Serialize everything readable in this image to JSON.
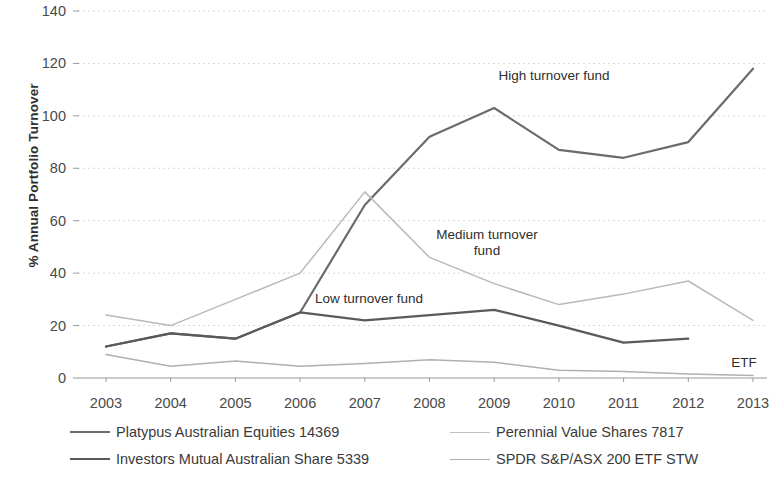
{
  "chart_data": {
    "type": "line",
    "title": "",
    "xlabel": "",
    "ylabel": "% Annual Portfolio Turnover",
    "x": [
      2003,
      2004,
      2005,
      2006,
      2007,
      2008,
      2009,
      2010,
      2011,
      2012,
      2013
    ],
    "xtick_labels": [
      "2003",
      "2004",
      "2005",
      "2006",
      "2007",
      "2008",
      "2009",
      "2010",
      "2011",
      "2012",
      "2013"
    ],
    "ytick_labels": [
      "0",
      "20",
      "40",
      "60",
      "80",
      "100",
      "120",
      "140"
    ],
    "yticks": [
      0,
      20,
      40,
      60,
      80,
      100,
      120,
      140
    ],
    "ylim": [
      0,
      140
    ],
    "grid": "horizontal-dotted",
    "legend_position": "bottom",
    "series": [
      {
        "name": "Platypus Australian Equities 14369",
        "color": "#6b6b6b",
        "width": 2.2,
        "x": [
          2003,
          2004,
          2005,
          2006,
          2007,
          2008,
          2009,
          2010,
          2011,
          2012,
          2013
        ],
        "values": [
          12,
          17,
          15,
          25,
          66,
          92,
          103,
          87,
          84,
          90,
          118
        ]
      },
      {
        "name": "Perennial Value Shares 7817",
        "color": "#b9b9b9",
        "width": 1.5,
        "x": [
          2003,
          2004,
          2005,
          2006,
          2007,
          2008,
          2009,
          2010,
          2011,
          2012,
          2013
        ],
        "values": [
          24,
          20,
          30,
          40,
          71,
          46,
          36,
          28,
          32,
          37,
          22
        ]
      },
      {
        "name": "Investors Mutual Australian Share 5339",
        "color": "#5a5a5a",
        "width": 2.2,
        "x": [
          2003,
          2004,
          2005,
          2006,
          2007,
          2008,
          2009,
          2010,
          2011,
          2012
        ],
        "values": [
          12,
          17,
          15,
          25,
          22,
          24,
          26,
          20,
          13.5,
          15
        ]
      },
      {
        "name": "SPDR S&P/ASX 200 ETF STW",
        "color": "#b0b0b0",
        "width": 1.5,
        "x": [
          2003,
          2004,
          2005,
          2006,
          2007,
          2008,
          2009,
          2010,
          2011,
          2012,
          2013
        ],
        "values": [
          9,
          4.5,
          6.5,
          4.5,
          5.5,
          7,
          6,
          3,
          2.5,
          1.5,
          1
        ]
      }
    ],
    "annotations": [
      {
        "id": "annot-high",
        "text": "High turnover fund"
      },
      {
        "id": "annot-medium",
        "text": "Medium turnover fund"
      },
      {
        "id": "annot-low",
        "text": "Low turnover fund"
      },
      {
        "id": "annot-etf",
        "text": "ETF"
      }
    ]
  },
  "legend": {
    "items": [
      {
        "label": "Platypus Australian Equities 14369",
        "color": "#6b6b6b",
        "width": 2.2
      },
      {
        "label": "Perennial Value Shares 7817",
        "color": "#c2c2c2",
        "width": 1.5
      },
      {
        "label": "Investors Mutual Australian Share 5339",
        "color": "#5a5a5a",
        "width": 2.2
      },
      {
        "label": "SPDR S&P/ASX 200 ETF STW",
        "color": "#b0b0b0",
        "width": 1.5
      }
    ]
  },
  "annotations": {
    "high": "High turnover fund",
    "medium_line1": "Medium turnover",
    "medium_line2": "fund",
    "low": "Low turnover fund",
    "etf": "ETF"
  },
  "axis": {
    "y_title": "% Annual Portfolio Turnover"
  },
  "colors": {
    "grid": "#d9d9d9",
    "axis": "#9a9a9a",
    "text": "#3b3b3b"
  }
}
